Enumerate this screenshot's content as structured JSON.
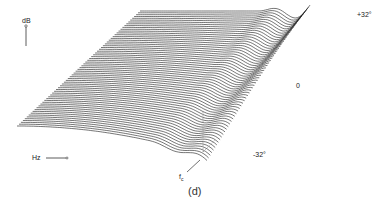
{
  "chart_data": {
    "type": "area",
    "subtype": "3d-waterfall",
    "title": "",
    "panel_label": "(d)",
    "xlabel": "Hz",
    "ylabel": "dB",
    "depth_label": "angle",
    "depth_ticks": [
      "+32°",
      "0",
      "-32°"
    ],
    "depth_range": [
      32,
      -32
    ],
    "marker_label": "fc",
    "marker_label_sub": "c",
    "num_traces": 64,
    "grid": false,
    "legend": null
  },
  "labels": {
    "db": "dB",
    "hz": "Hz",
    "plus32": "+32°",
    "zero": "0",
    "minus32": "-32°",
    "fc_main": "f",
    "fc_sub": "c",
    "panel": "(d)"
  }
}
